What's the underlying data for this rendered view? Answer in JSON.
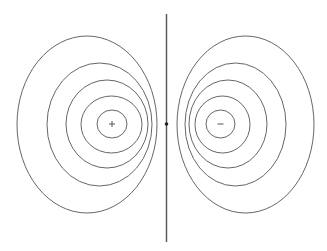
{
  "diagram": {
    "title": "",
    "colors": {
      "background": "#ffffff",
      "contour": "#666666",
      "line": "#555555",
      "dot": "#222222"
    },
    "bisector": {
      "x": 166.5,
      "y1": 14,
      "y2": 242
    },
    "midpoint_dot": {
      "cx": 166.5,
      "cy": 124,
      "r": 1.8
    },
    "charges": [
      {
        "sign": "+",
        "label": "+",
        "cx": 112,
        "cy": 124
      },
      {
        "sign": "-",
        "label": "−",
        "cx": 220.5,
        "cy": 124
      }
    ],
    "left_contours": [
      {
        "cx": 87,
        "cy": 124.5,
        "rx": 70,
        "ry": 88.5
      },
      {
        "cx": 99.5,
        "cy": 124.5,
        "rx": 52.5,
        "ry": 61.5
      },
      {
        "cx": 107,
        "cy": 124,
        "rx": 41,
        "ry": 44
      },
      {
        "cx": 111.5,
        "cy": 124.5,
        "rx": 30.5,
        "ry": 28.5
      },
      {
        "cx": 112,
        "cy": 124,
        "rx": 15,
        "ry": 14
      }
    ],
    "right_contours": [
      {
        "cx": 245.5,
        "cy": 124.5,
        "rx": 68.5,
        "ry": 88.5
      },
      {
        "cx": 235.5,
        "cy": 124.5,
        "rx": 50.5,
        "ry": 61.5
      },
      {
        "cx": 228,
        "cy": 124,
        "rx": 39,
        "ry": 44
      },
      {
        "cx": 222.5,
        "cy": 124.5,
        "rx": 27.5,
        "ry": 28.5
      },
      {
        "cx": 220.5,
        "cy": 124,
        "rx": 14.5,
        "ry": 14
      }
    ]
  }
}
